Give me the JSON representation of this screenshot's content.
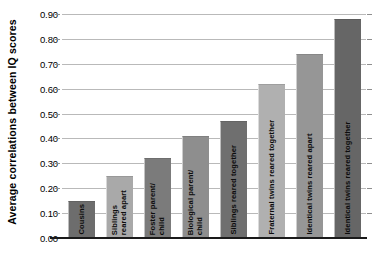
{
  "chart_data": {
    "type": "bar",
    "title": "",
    "xlabel": "",
    "ylabel": "Average correlations between IQ scores",
    "ylim": [
      0.0,
      0.9
    ],
    "ytick_step": 0.1,
    "grid": true,
    "legend": "none",
    "ytick_labels": [
      "0.90",
      "0.80",
      "0.70",
      "0.60",
      "0.50",
      "0.40",
      "0.30",
      "0.20",
      "0.10",
      "0.00"
    ],
    "ytick_values": [
      0.9,
      0.8,
      0.7,
      0.6,
      0.5,
      0.4,
      0.3,
      0.2,
      0.1,
      0.0
    ],
    "categories": [
      "Cousins",
      "Siblings reared apart",
      "Foster parent/child",
      "Biological parent/child",
      "Siblings reared together",
      "Fraternal twins reared together",
      "Identical twins reared apart",
      "Identical twins reared together"
    ],
    "category_lines": [
      [
        "Cousins"
      ],
      [
        "Siblings",
        "reared apart"
      ],
      [
        "Foster parent/",
        "child"
      ],
      [
        "Biological parent/",
        "child"
      ],
      [
        "Siblings reared together"
      ],
      [
        "Fraternal twins reared together"
      ],
      [
        "Identical twins reared apart"
      ],
      [
        "Identical twins reared together"
      ]
    ],
    "values": [
      0.15,
      0.25,
      0.32,
      0.41,
      0.47,
      0.62,
      0.74,
      0.88
    ],
    "bar_colors": [
      "#6d6d6d",
      "#a9a9a9",
      "#7b7b7b",
      "#8e8e8e",
      "#6f6f6f",
      "#b0b0b0",
      "#969696",
      "#666666"
    ]
  },
  "axis": {
    "y_title": "Average correlations between IQ scores"
  },
  "colors": {
    "gridline": "#b9b9b9",
    "baseline": "#1a1a1a",
    "background": "#ffffff",
    "text": "#000000"
  }
}
